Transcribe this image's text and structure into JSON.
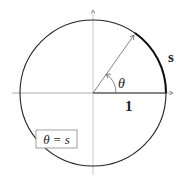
{
  "diagram": {
    "arc_label": "s",
    "radius_label": "1",
    "angle_label": "θ",
    "equation_label": "θ = s",
    "colors": {
      "circle": "#222222",
      "axes": "#999999",
      "radius": "#777777",
      "arc": "#111111",
      "box": "#888888"
    }
  }
}
